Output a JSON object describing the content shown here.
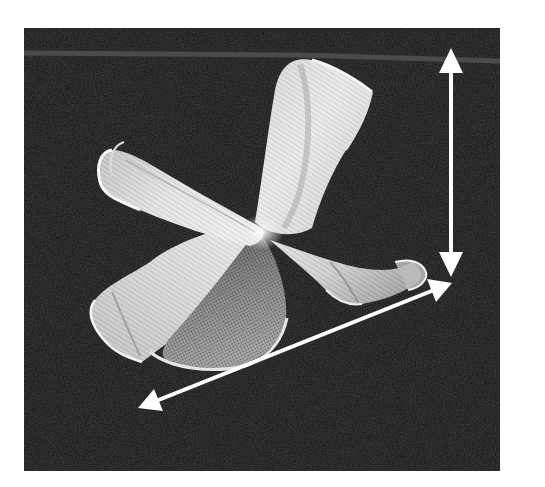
{
  "figure": {
    "photo_frame": {
      "x": 24,
      "y": 28,
      "width": 476,
      "height": 443
    },
    "colors": {
      "page_background": "#ffffff",
      "photo_background": "#131313",
      "horizon_line": "#4a4a4a",
      "mesh_light": "#e8e8e8",
      "mesh_mid": "#b9b9b9",
      "mesh_shadow": "#6a6a6a",
      "arrow": "#ffffff"
    },
    "annotations": {
      "vertical_arrow": {
        "name": "height-dimension-arrow",
        "x1": 451,
        "y1": 48,
        "x2": 451,
        "y2": 276
      },
      "diagonal_arrow": {
        "name": "width-dimension-arrow",
        "x1": 138,
        "y1": 408,
        "x2": 452,
        "y2": 283
      }
    }
  }
}
